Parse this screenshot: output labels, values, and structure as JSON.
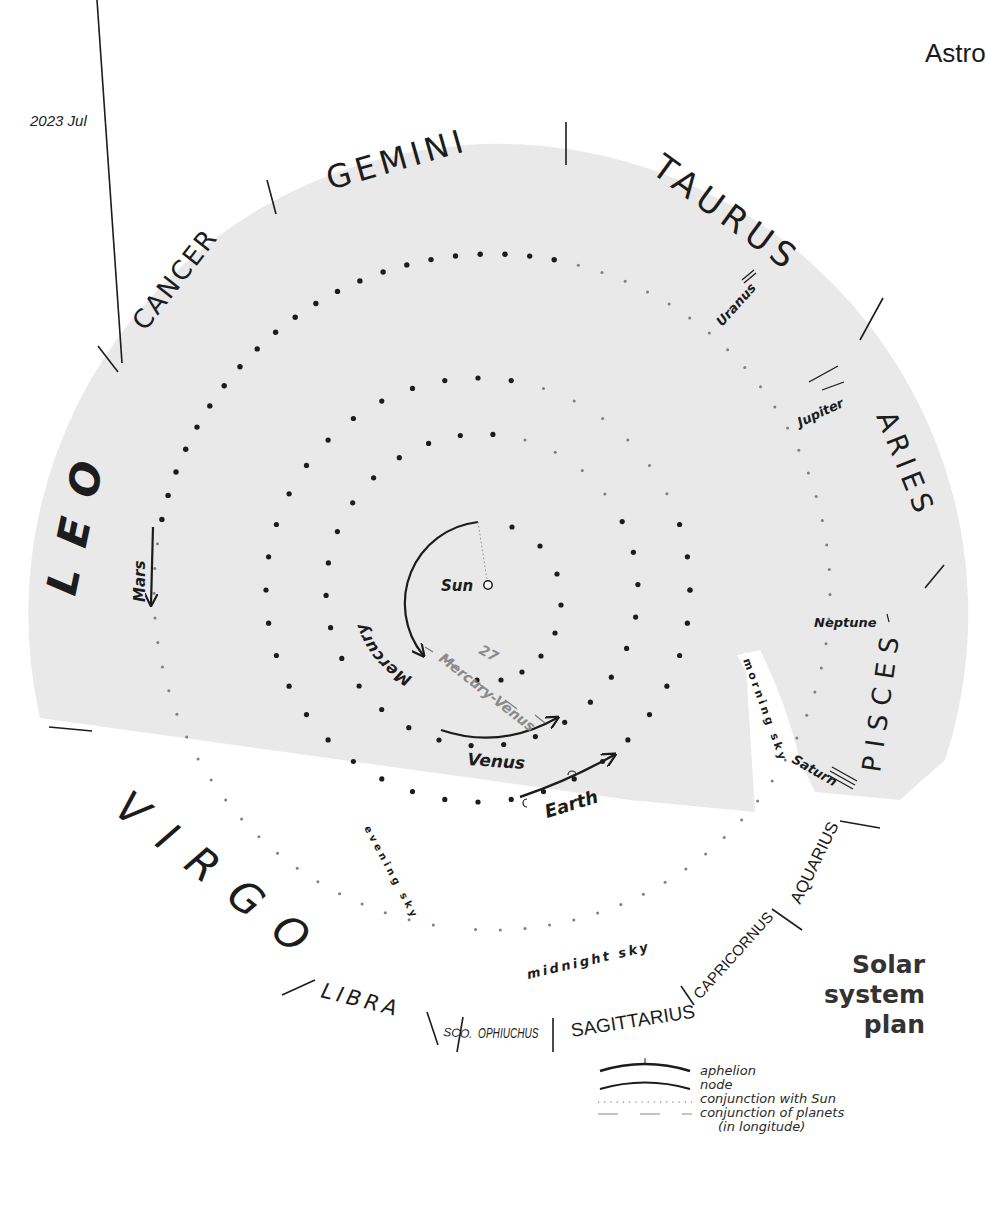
{
  "header": {
    "title_fragment": "Astro"
  },
  "date": "2023 Jul",
  "title": {
    "line1": "Solar",
    "line2": "system",
    "line3": "plan"
  },
  "colors": {
    "day_region": "#e9e9e9",
    "ink": "#1c1c1c",
    "conjunction_gray": "#8a8a8a",
    "background": "#ffffff"
  },
  "zodiac": [
    {
      "name": "LEO"
    },
    {
      "name": "CANCER"
    },
    {
      "name": "GEMINI"
    },
    {
      "name": "TAURUS"
    },
    {
      "name": "ARIES"
    },
    {
      "name": "PISCES"
    },
    {
      "name": "AQUARIUS"
    },
    {
      "name": "CAPRICORNUS"
    },
    {
      "name": "SAGITTARIUS"
    },
    {
      "name": "OPHIUCHUS"
    },
    {
      "name": "SCO."
    },
    {
      "name": "LIBRA"
    },
    {
      "name": "VIRGO"
    }
  ],
  "planets": {
    "sun": "Sun",
    "mercury": "Mercury",
    "venus": "Venus",
    "earth": "Earth",
    "mars": "Mars",
    "jupiter": "Jupiter",
    "saturn": "Saturn",
    "uranus": "Uranus",
    "neptune": "Neptune"
  },
  "conjunction": {
    "day": "27",
    "label": "Mercury-Venus"
  },
  "sky_regions": {
    "morning": "morning sky",
    "evening": "evening sky",
    "midnight": "midnight sky"
  },
  "legend": [
    {
      "symbol": "aphelion-line",
      "label": "aphelion"
    },
    {
      "symbol": "node-line",
      "label": "node"
    },
    {
      "symbol": "dotted-line",
      "label": "conjunction with Sun"
    },
    {
      "symbol": "dashed-line",
      "label": "conjunction of planets"
    },
    {
      "symbol": "none",
      "label": "(in longitude)"
    }
  ]
}
